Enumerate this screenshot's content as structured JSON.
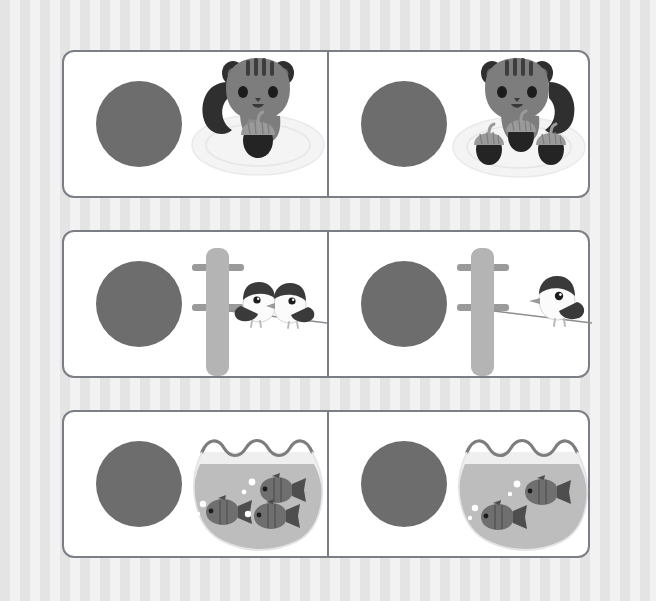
{
  "worksheet": {
    "title": "Count and Compare Worksheet",
    "background_pattern": "vertical-stripes",
    "background_colors": [
      "#e4e4e4",
      "#f2f2f2"
    ],
    "board_border_color": "#7b7f85",
    "board_fill_color": "#ffffff",
    "answer_circle_color": "#6d6d6d",
    "rows": [
      {
        "row_index": 1,
        "theme": "squirrel-acorns",
        "left": {
          "answer_placeholder_label": "answer circle",
          "subject": "squirrel",
          "object": "acorn",
          "count": 1,
          "count_label": "1",
          "container": "plate"
        },
        "right": {
          "answer_placeholder_label": "answer circle",
          "subject": "squirrel",
          "object": "acorn",
          "count": 3,
          "count_label": "3",
          "container": "plate"
        }
      },
      {
        "row_index": 2,
        "theme": "birds-on-wire",
        "left": {
          "answer_placeholder_label": "answer circle",
          "subject": "bird",
          "object": "bird",
          "count": 2,
          "count_label": "2",
          "container": "utility pole and wire"
        },
        "right": {
          "answer_placeholder_label": "answer circle",
          "subject": "bird",
          "object": "bird",
          "count": 1,
          "count_label": "1",
          "container": "utility pole and wire"
        }
      },
      {
        "row_index": 3,
        "theme": "fish-in-bowl",
        "left": {
          "answer_placeholder_label": "answer circle",
          "subject": "fish",
          "object": "fish",
          "count": 3,
          "count_label": "3",
          "container": "fishbowl"
        },
        "right": {
          "answer_placeholder_label": "answer circle",
          "subject": "fish",
          "object": "fish",
          "count": 2,
          "count_label": "2",
          "container": "fishbowl"
        }
      }
    ],
    "palette": {
      "squirrel_body": "#7d7d7d",
      "squirrel_dark": "#2f2f2f",
      "acorn_cap": "#9a9a9a",
      "acorn_nut": "#242424",
      "plate": "#f4f4f4",
      "bird_body": "#fbfbfb",
      "bird_dark": "#3a3a3a",
      "pole": "#b4b4b4",
      "crossarm": "#9a9a9a",
      "bowl_water": "#bdbdbd",
      "bowl_glass": "#efefef",
      "fish_body": "#6f6f6f",
      "fish_dark": "#333333"
    }
  }
}
